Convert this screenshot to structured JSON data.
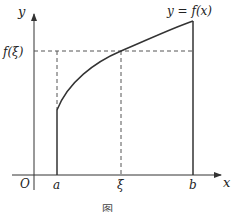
{
  "figure": {
    "axes": {
      "x_label": "x",
      "y_label": "y",
      "origin_label": "O"
    },
    "ticks": {
      "a": "a",
      "xi": "ξ",
      "b": "b",
      "f_xi": "f(ξ)"
    },
    "curve_label": "y = f(x)",
    "caption": "图 ..",
    "colors": {
      "line": "#333333",
      "dashed": "#555555",
      "background": "#ffffff"
    }
  }
}
